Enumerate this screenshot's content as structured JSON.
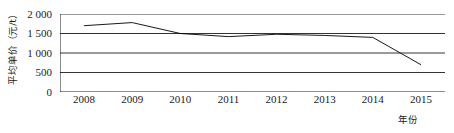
{
  "chart_data": {
    "type": "line",
    "title": "",
    "xlabel": "年份",
    "ylabel": "平均单价（元/t）",
    "categories": [
      "2008",
      "2009",
      "2010",
      "2011",
      "2012",
      "2013",
      "2014",
      "2015"
    ],
    "x": [
      2008,
      2009,
      2010,
      2011,
      2012,
      2013,
      2014,
      2015
    ],
    "values": [
      1700,
      1780,
      1500,
      1420,
      1480,
      1450,
      1400,
      700
    ],
    "series": [
      {
        "name": "平均单价",
        "values": [
          1700,
          1780,
          1500,
          1420,
          1480,
          1450,
          1400,
          700
        ]
      }
    ],
    "ylim": [
      0,
      2000
    ],
    "ytick_values": [
      0,
      500,
      1000,
      1500,
      2000
    ],
    "ytick_labels": [
      "0",
      "500",
      "1 000",
      "1 500",
      "2 000"
    ],
    "grid": "horizontal",
    "legend": "none",
    "line_color": "#000000",
    "grid_color": "#000000",
    "markers": "none"
  },
  "axes": {
    "y_title": "平均单价（元/t）",
    "x_title": "年份"
  }
}
